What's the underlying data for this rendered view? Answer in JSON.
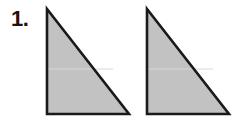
{
  "page": {
    "width": 237,
    "height": 122,
    "background_color": "#ffffff"
  },
  "question": {
    "number_label": "1."
  },
  "figure": {
    "caption": "",
    "shape_fill_color": "#c2c2c2",
    "shape_stroke_color": "#1a1a1a",
    "shape_stroke_width": 2.6,
    "seam_color": "#d8d8d8",
    "shapes": [
      {
        "name": "triangle-left",
        "type": "right-triangle",
        "points": "47,9 47,114 129,114",
        "apex": "47,9",
        "bottom_left": "47,114",
        "bottom_right": "129,114",
        "seam": "48,69 113,69"
      },
      {
        "name": "triangle-right",
        "type": "right-triangle",
        "points": "147,9 147,114 229,114",
        "apex": "147,9",
        "bottom_left": "147,114",
        "bottom_right": "229,114",
        "seam": "148,69 213,69"
      }
    ]
  }
}
